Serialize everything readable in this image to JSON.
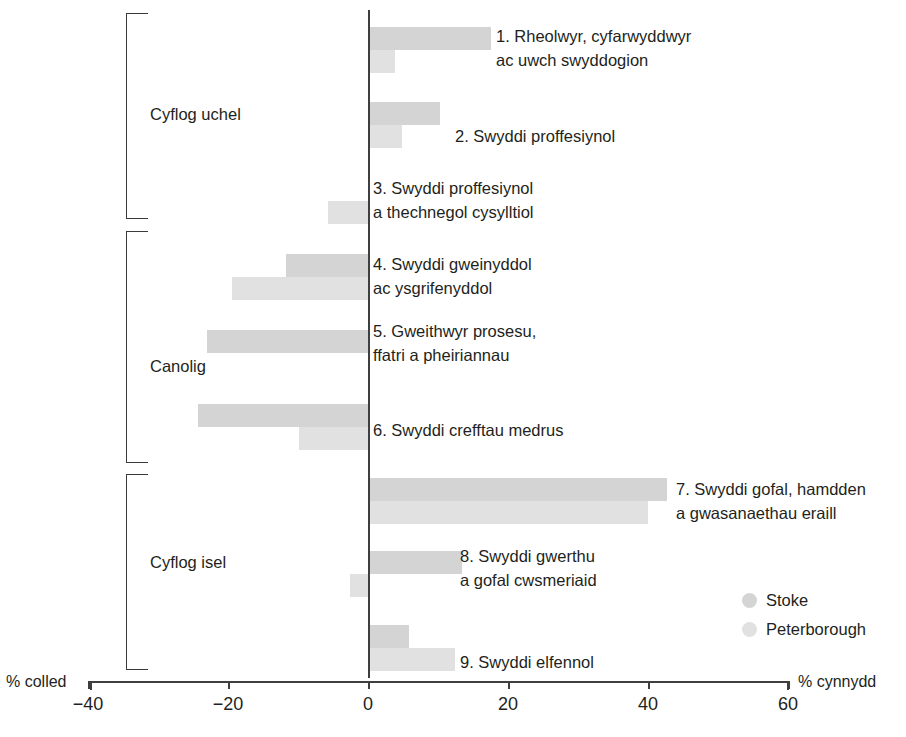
{
  "chart_data": {
    "type": "bar",
    "orientation": "horizontal",
    "title": "",
    "xlabel": "",
    "ylabel": "",
    "xlim": [
      -40,
      60
    ],
    "xticks": [
      -40,
      -20,
      0,
      20,
      40,
      60
    ],
    "xtick_labels": [
      "−40",
      "−20",
      "0",
      "20",
      "40",
      "60"
    ],
    "grid": false,
    "axis_left_label": "% colled",
    "axis_right_label": "% cynnydd",
    "legend_position": "bottom-right",
    "categories": [
      "1. Rheolwyr, cyfarwyddwyr ac uwch swyddogion",
      "2. Swyddi proffesiynol",
      "3. Swyddi proffesiynol a thechnegol cysylltiol",
      "4. Swyddi gweinyddol ac ysgrifenyddol",
      "5. Gweithwyr prosesu, ffatri a pheiriannau",
      "6. Swyddi crefftau medrus",
      "7. Swyddi gofal, hamdden a gwasanaethau eraill",
      "8. Swyddi gwerthu a gofal cwsmeriaid",
      "9. Swyddi elfennol"
    ],
    "series": [
      {
        "name": "Stoke",
        "color": "#d4d4d4",
        "values": [
          17.6,
          10.3,
          0,
          -11.7,
          -23.0,
          -24.3,
          42.7,
          13.4,
          5.9
        ]
      },
      {
        "name": "Peterborough",
        "color": "#e1e1e1",
        "values": [
          3.9,
          4.9,
          -5.7,
          -19.4,
          0,
          -9.9,
          40.0,
          -2.6,
          12.4
        ]
      }
    ],
    "groups": [
      {
        "label": "Cyflog uchel",
        "members": [
          1,
          2,
          3
        ]
      },
      {
        "label": "Canolig",
        "members": [
          4,
          5,
          6
        ]
      },
      {
        "label": "Cyflog isel",
        "members": [
          7,
          8,
          9
        ]
      }
    ]
  },
  "bar_labels": [
    {
      "line1": "1. Rheolwyr, cyfarwyddwyr",
      "line2": "ac uwch swyddogion"
    },
    {
      "line1": "2. Swyddi proffesiynol",
      "line2": ""
    },
    {
      "line1": "3. Swyddi proffesiynol",
      "line2": "a thechnegol cysylltiol"
    },
    {
      "line1": "4. Swyddi gweinyddol",
      "line2": "ac ysgrifenyddol"
    },
    {
      "line1": "5. Gweithwyr prosesu,",
      "line2": "ffatri a pheiriannau"
    },
    {
      "line1": "6. Swyddi crefftau medrus",
      "line2": ""
    },
    {
      "line1": "7. Swyddi gofal, hamdden",
      "line2": "a gwasanaethau eraill"
    },
    {
      "line1": "8. Swyddi gwerthu",
      "line2": "a gofal cwsmeriaid"
    },
    {
      "line1": "9. Swyddi elfennol",
      "line2": ""
    }
  ],
  "groups": [
    {
      "label": "Cyflog uchel"
    },
    {
      "label": "Canolig"
    },
    {
      "label": "Cyflog isel"
    }
  ],
  "axis": {
    "left_label": "% colled",
    "right_label": "% cynnydd",
    "ticks": [
      "−40",
      "−20",
      "0",
      "20",
      "40",
      "60"
    ]
  },
  "legend": [
    {
      "label": "Stoke",
      "color": "#d4d4d4"
    },
    {
      "label": "Peterborough",
      "color": "#e1e1e1"
    }
  ]
}
